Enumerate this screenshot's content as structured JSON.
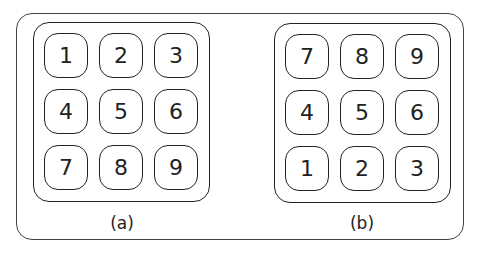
{
  "panels": [
    {
      "caption": "(a)",
      "keys": [
        "1",
        "2",
        "3",
        "4",
        "5",
        "6",
        "7",
        "8",
        "9"
      ]
    },
    {
      "caption": "(b)",
      "keys": [
        "7",
        "8",
        "9",
        "4",
        "5",
        "6",
        "1",
        "2",
        "3"
      ]
    }
  ]
}
